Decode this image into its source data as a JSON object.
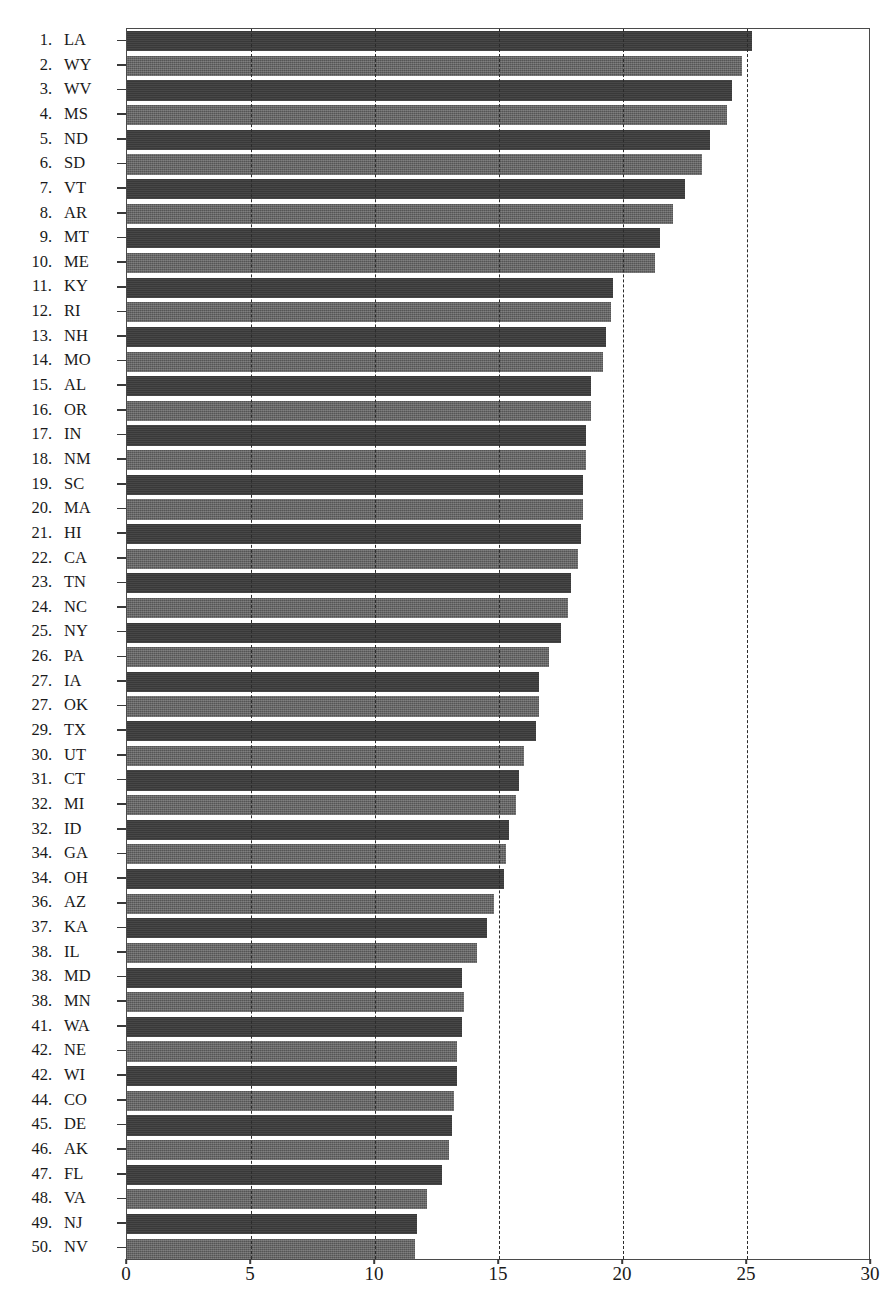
{
  "chart_data": {
    "type": "bar",
    "orientation": "horizontal",
    "title": "",
    "subtitle": "",
    "xlabel": "",
    "ylabel": "",
    "xlim": [
      0,
      30
    ],
    "xticks": [
      "0",
      "5",
      "10",
      "15",
      "20",
      "25",
      "30"
    ],
    "xtick_values": [
      0,
      5,
      10,
      15,
      20,
      25,
      30
    ],
    "grid": "vertical-dashed",
    "legend": "none",
    "categories": [
      "LA",
      "WY",
      "WV",
      "MS",
      "ND",
      "SD",
      "VT",
      "AR",
      "MT",
      "ME",
      "KY",
      "RI",
      "NH",
      "MO",
      "AL",
      "OR",
      "IN",
      "NM",
      "SC",
      "MA",
      "HI",
      "CA",
      "TN",
      "NC",
      "NY",
      "PA",
      "IA",
      "OK",
      "TX",
      "UT",
      "CT",
      "MI",
      "ID",
      "GA",
      "OH",
      "AZ",
      "KA",
      "IL",
      "MD",
      "MN",
      "WA",
      "NE",
      "WI",
      "CO",
      "DE",
      "AK",
      "FL",
      "VA",
      "NJ",
      "NV"
    ],
    "ranks": [
      "1.",
      "2.",
      "3.",
      "4.",
      "5.",
      "6.",
      "7.",
      "8.",
      "9.",
      "10.",
      "11.",
      "12.",
      "13.",
      "14.",
      "15.",
      "16.",
      "17.",
      "18.",
      "19.",
      "20.",
      "21.",
      "22.",
      "23.",
      "24.",
      "25.",
      "26.",
      "27.",
      "27.",
      "29.",
      "30.",
      "31.",
      "32.",
      "32.",
      "34.",
      "34.",
      "36.",
      "37.",
      "38.",
      "38.",
      "38.",
      "41.",
      "42.",
      "42.",
      "44.",
      "45.",
      "46.",
      "47.",
      "48.",
      "49.",
      "50."
    ],
    "values": [
      25.2,
      24.8,
      24.4,
      24.2,
      23.5,
      23.2,
      22.5,
      22.0,
      21.5,
      21.3,
      19.6,
      19.5,
      19.3,
      19.2,
      18.7,
      18.7,
      18.5,
      18.5,
      18.4,
      18.4,
      18.3,
      18.2,
      17.9,
      17.8,
      17.5,
      17.0,
      16.6,
      16.6,
      16.5,
      16.0,
      15.8,
      15.7,
      15.4,
      15.3,
      15.2,
      14.8,
      14.5,
      14.1,
      13.5,
      13.6,
      13.5,
      13.3,
      13.3,
      13.2,
      13.1,
      13.0,
      12.7,
      12.1,
      11.7,
      11.6
    ],
    "bar_colors": {
      "dark": "#393939",
      "light": "#555555"
    },
    "axis_color": "#4a4a4a",
    "grid_color": "#2b2b2b"
  }
}
